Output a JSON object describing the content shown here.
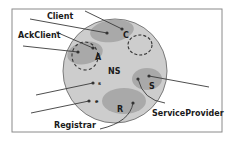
{
  "diagram": {
    "type": "component-overlap-diagram",
    "colors": {
      "background": "#ffffff",
      "frame": "#8a8a8a",
      "outer_circle": "#cdcdcd",
      "outer_circle_stroke": "#7a7a7a",
      "inner_region": "#a9a9a9",
      "line": "#3a3a3a",
      "dot": "#333333"
    },
    "center": {
      "label": "NS"
    },
    "regions": [
      {
        "id": "client-region",
        "label": "C"
      },
      {
        "id": "ackclient-region",
        "label": "A"
      },
      {
        "id": "serviceprovider-region",
        "label": "S"
      },
      {
        "id": "registrar-region",
        "label": "R"
      }
    ],
    "small_markers": [
      {
        "id": "marker-s",
        "label": "s"
      },
      {
        "id": "marker-e",
        "label": "e"
      }
    ],
    "external_labels": {
      "client": "Client",
      "ackclient": "AckClient",
      "registrar": "Registrar",
      "serviceprovider": "ServiceProvider"
    }
  }
}
